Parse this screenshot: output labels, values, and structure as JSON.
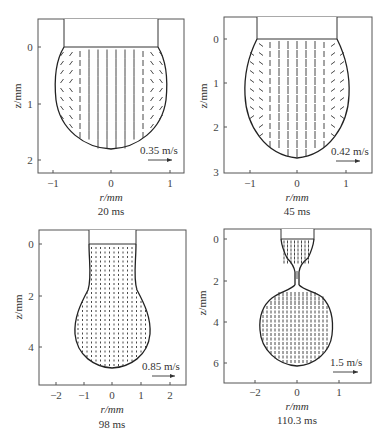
{
  "figure": {
    "panels": [
      {
        "id": "a",
        "caption": "20 ms",
        "xlabel": "r/mm",
        "ylabel": "z/mm",
        "scale_label": "0.35 m/s",
        "frame": {
          "left": 38,
          "top": 19,
          "right": 184,
          "bottom": 173
        },
        "x_ticks": [
          {
            "v": -1,
            "label": "−1",
            "px": 53
          },
          {
            "v": 0,
            "label": "0",
            "px": 111
          },
          {
            "v": 1,
            "label": "1",
            "px": 170
          }
        ],
        "y_ticks": [
          {
            "v": 0,
            "label": "0",
            "py": 47
          },
          {
            "v": 1,
            "label": "1",
            "py": 104
          },
          {
            "v": 2,
            "label": "2",
            "py": 160
          }
        ]
      },
      {
        "id": "b",
        "caption": "45 ms",
        "xlabel": "r/mm",
        "ylabel": "z/mm",
        "scale_label": "0.42 m/s",
        "frame": {
          "left": 224,
          "top": 17,
          "right": 372,
          "bottom": 173
        },
        "x_ticks": [
          {
            "v": -1,
            "label": "−1",
            "px": 250
          },
          {
            "v": 0,
            "label": "0",
            "px": 297
          },
          {
            "v": 1,
            "label": "1",
            "px": 346
          }
        ],
        "y_ticks": [
          {
            "v": 0,
            "label": "0",
            "py": 39
          },
          {
            "v": 1,
            "label": "1",
            "py": 83
          },
          {
            "v": 2,
            "label": "2",
            "py": 127
          },
          {
            "v": 3,
            "label": "3",
            "py": 172
          }
        ]
      },
      {
        "id": "c",
        "caption": "98 ms",
        "xlabel": "r/mm",
        "ylabel": "z/mm",
        "scale_label": "0.85 m/s",
        "frame": {
          "left": 39,
          "top": 230,
          "right": 186,
          "bottom": 385
        },
        "x_ticks": [
          {
            "v": -2,
            "label": "−2",
            "px": 56
          },
          {
            "v": -1,
            "label": "−1",
            "px": 84
          },
          {
            "v": 0,
            "label": "0",
            "px": 112
          },
          {
            "v": 1,
            "label": "1",
            "px": 141
          },
          {
            "v": 2,
            "label": "2",
            "px": 170
          }
        ],
        "y_ticks": [
          {
            "v": 0,
            "label": "0",
            "py": 244
          },
          {
            "v": 2,
            "label": "2",
            "py": 296
          },
          {
            "v": 4,
            "label": "4",
            "py": 347
          }
        ]
      },
      {
        "id": "d",
        "caption": "110.3 ms",
        "xlabel": "r/mm",
        "ylabel": "z/mm",
        "scale_label": "1.5 m/s",
        "frame": {
          "left": 224,
          "top": 229,
          "right": 371,
          "bottom": 383
        },
        "x_ticks": [
          {
            "v": -2,
            "label": "−2",
            "px": 255
          },
          {
            "v": 0,
            "label": "0",
            "px": 297
          },
          {
            "v": 1,
            "label": "1",
            "px": 339
          }
        ],
        "y_ticks": [
          {
            "v": 0,
            "label": "0",
            "py": 239
          },
          {
            "v": 2,
            "label": "2",
            "py": 281
          },
          {
            "v": 4,
            "label": "4",
            "py": 322
          },
          {
            "v": 6,
            "label": "6",
            "py": 363
          }
        ]
      }
    ]
  },
  "chart_data": [
    {
      "type": "vector-field",
      "title": "Droplet internal velocity field at 20 ms",
      "caption": "20 ms",
      "xlabel": "r/mm",
      "ylabel": "z/mm",
      "xlim": [
        -1.25,
        1.25
      ],
      "ylim": [
        2.2,
        -0.5
      ],
      "x_ticks": [
        -1,
        0,
        1
      ],
      "y_ticks": [
        0,
        1,
        2
      ],
      "reference_vector": "0.35 m/s",
      "nozzle_radius_mm": 0.8,
      "droplet_max_radius_mm": 0.95,
      "droplet_tip_z_mm": 1.77,
      "flow": "central downward jet with recirculating vortices near sides"
    },
    {
      "type": "vector-field",
      "title": "Droplet internal velocity field at 45 ms",
      "caption": "45 ms",
      "xlabel": "r/mm",
      "ylabel": "z/mm",
      "xlim": [
        -1.45,
        1.5
      ],
      "ylim": [
        3.0,
        -0.5
      ],
      "x_ticks": [
        -1,
        0,
        1
      ],
      "y_ticks": [
        0,
        1,
        2,
        3
      ],
      "reference_vector": "0.42 m/s",
      "nozzle_radius_mm": 0.8,
      "droplet_max_radius_mm": 1.07,
      "droplet_tip_z_mm": 2.7,
      "flow": "central downward flow with side vortices in lower half"
    },
    {
      "type": "vector-field",
      "title": "Droplet internal velocity field at 98 ms",
      "caption": "98 ms",
      "xlabel": "r/mm",
      "ylabel": "z/mm",
      "xlim": [
        -2.4,
        2.5
      ],
      "ylim": [
        5.5,
        -0.5
      ],
      "x_ticks": [
        -2,
        -1,
        0,
        1,
        2
      ],
      "y_ticks": [
        0,
        2,
        4
      ],
      "reference_vector": "0.85 m/s",
      "nozzle_radius_mm": 0.8,
      "droplet_max_radius_mm": 1.3,
      "droplet_tip_z_mm": 4.85,
      "flow": "nearly uniform downward flow"
    },
    {
      "type": "vector-field",
      "title": "Droplet internal velocity field at 110.3 ms (pinch-off)",
      "caption": "110.3 ms",
      "xlabel": "r/mm",
      "ylabel": "z/mm",
      "xlim": [
        -2.7,
        1.7
      ],
      "ylim": [
        7.0,
        -0.5
      ],
      "x_ticks": [
        -2,
        0,
        1
      ],
      "y_ticks": [
        0,
        2,
        4,
        6
      ],
      "reference_vector": "1.5 m/s",
      "nozzle_radius_mm": 0.4,
      "neck_z_mm": [
        1.0,
        2.2
      ],
      "droplet_max_radius_mm": 0.7,
      "droplet_tip_z_mm": 6.2,
      "flow": "necking; upward flow above neck, downward flow in detaching drop"
    }
  ]
}
